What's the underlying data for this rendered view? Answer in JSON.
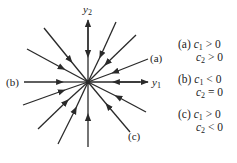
{
  "diagram": {
    "axes": {
      "horizontal_label": "y1",
      "vertical_label": "y2"
    },
    "origin": [
      88,
      82
    ],
    "trajectory_labels": {
      "a": "(a)",
      "b": "(b)",
      "c": "(c)"
    },
    "conditions": [
      {
        "label": "(a)",
        "line1": "c1 > 0",
        "line2": "c2 > 0",
        "c1_rel": ">",
        "c2_rel": ">",
        "c1_rhs": "0",
        "c2_rhs": "0"
      },
      {
        "label": "(b)",
        "line1": "c1 < 0",
        "line2": "c2 = 0",
        "c1_rel": "<",
        "c2_rel": "=",
        "c1_rhs": "0",
        "c2_rhs": "0"
      },
      {
        "label": "(c)",
        "line1": "c1 > 0",
        "line2": "c2 < 0",
        "c1_rel": ">",
        "c2_rel": "<",
        "c1_rhs": "0",
        "c2_rhs": "0"
      }
    ],
    "line_color": "#2a2a2a"
  }
}
